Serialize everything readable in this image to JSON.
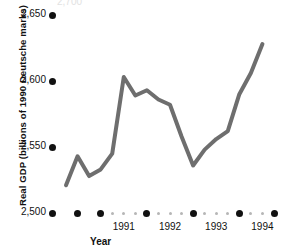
{
  "chart_data": {
    "type": "line",
    "title": "",
    "xlabel": "Year",
    "ylabel": "Real GDP (billions of 1990 Deutsche marks)",
    "ylim": [
      2500,
      2650
    ],
    "yticks": [
      2500,
      2550,
      2600,
      2650
    ],
    "ytick_labels": [
      "2,500",
      "2,550",
      "2,600",
      "2,650"
    ],
    "xlim": [
      1990.25,
      1994.75
    ],
    "xticks": [
      1991,
      1992,
      1993,
      1994
    ],
    "xtick_labels": [
      "1991",
      "1992",
      "1993",
      "1994"
    ],
    "grid": false,
    "legend": null,
    "line_color": "#6e6e6e",
    "line_width": 4,
    "x_minor_tick_note": "quarterly gray dots between annual black dots",
    "x": [
      1990.25,
      1990.5,
      1990.75,
      1991.0,
      1991.25,
      1991.5,
      1991.75,
      1992.0,
      1992.25,
      1992.5,
      1992.75,
      1993.0,
      1993.25,
      1993.5,
      1993.75,
      1994.0,
      1994.25,
      1994.5
    ],
    "values": [
      2521,
      2543,
      2528,
      2533,
      2545,
      2603,
      2589,
      2593,
      2586,
      2582,
      2558,
      2536,
      2548,
      2556,
      2562,
      2590,
      2606,
      2628
    ],
    "series": [
      {
        "name": "Real GDP",
        "values": [
          2521,
          2543,
          2528,
          2533,
          2545,
          2603,
          2589,
          2593,
          2586,
          2582,
          2558,
          2536,
          2548,
          2556,
          2562,
          2590,
          2606,
          2628
        ]
      }
    ],
    "annotations": []
  },
  "axes": {
    "y_title": "Real GDP (billions of 1990 Deutsche marks)",
    "x_title": "Year"
  },
  "ghost": {
    "clipped_label": "2,700"
  }
}
